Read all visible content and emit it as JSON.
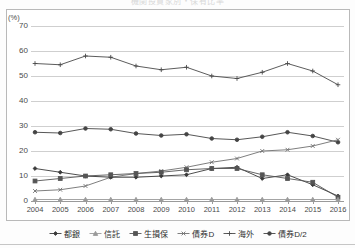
{
  "title": "機関投資家別・保有比率",
  "axis": {
    "y_unit": "(%)",
    "y_ticks": [
      70,
      60,
      50,
      40,
      30,
      20,
      10,
      0
    ],
    "y_min": 0,
    "y_max": 70,
    "x_ticks": [
      2004,
      2005,
      2006,
      2007,
      2008,
      2009,
      2010,
      2011,
      2012,
      2013,
      2014,
      2015,
      2016
    ]
  },
  "legend": {
    "position": "bottom",
    "items": [
      {
        "label": "都銀",
        "color": "#3a3a3a",
        "marker": "diamond"
      },
      {
        "label": "信託",
        "color": "#9a9a9a",
        "marker": "triangle"
      },
      {
        "label": "生損保",
        "color": "#555555",
        "marker": "square"
      },
      {
        "label": "債券D",
        "color": "#6f6f6f",
        "marker": "cross"
      },
      {
        "label": "海外",
        "color": "#4a4a4a",
        "marker": "plus"
      },
      {
        "label": "債券D/2",
        "color": "#444444",
        "marker": "dot"
      }
    ]
  },
  "chart_data": {
    "type": "line",
    "title": "機関投資家別・保有比率",
    "xlabel": "",
    "ylabel": "(%)",
    "ylim": [
      0,
      70
    ],
    "grid": true,
    "legend_position": "bottom",
    "categories": [
      2004,
      2005,
      2006,
      2007,
      2008,
      2009,
      2010,
      2011,
      2012,
      2013,
      2014,
      2015,
      2016
    ],
    "series": [
      {
        "name": "海外",
        "color": "#4a4a4a",
        "marker": "plus",
        "values": [
          55.0,
          54.5,
          58.0,
          57.5,
          54.0,
          52.5,
          53.5,
          50.0,
          49.0,
          51.5,
          55.0,
          52.0,
          46.5
        ]
      },
      {
        "name": "債券D/2",
        "color": "#444444",
        "marker": "dot",
        "values": [
          27.5,
          27.2,
          29.0,
          28.7,
          27.0,
          26.2,
          26.7,
          25.0,
          24.5,
          25.7,
          27.5,
          26.0,
          23.5
        ]
      },
      {
        "name": "債券D",
        "color": "#6f6f6f",
        "marker": "cross",
        "values": [
          4.0,
          4.5,
          6.0,
          9.5,
          11.0,
          12.0,
          13.5,
          15.5,
          17.0,
          20.0,
          20.5,
          22.0,
          24.5
        ]
      },
      {
        "name": "都銀",
        "color": "#3a3a3a",
        "marker": "diamond",
        "values": [
          13.0,
          11.5,
          10.0,
          9.5,
          9.5,
          10.0,
          10.5,
          13.0,
          13.5,
          9.0,
          10.5,
          6.5,
          2.0
        ]
      },
      {
        "name": "生損保",
        "color": "#555555",
        "marker": "square",
        "values": [
          8.0,
          9.0,
          10.0,
          10.5,
          11.0,
          11.5,
          12.5,
          13.0,
          13.0,
          10.5,
          9.0,
          7.5,
          1.5
        ]
      },
      {
        "name": "信託",
        "color": "#9a9a9a",
        "marker": "triangle",
        "values": [
          0.6,
          0.6,
          0.6,
          0.6,
          0.6,
          0.6,
          0.6,
          0.6,
          0.6,
          0.6,
          0.6,
          0.6,
          0.6
        ]
      }
    ]
  }
}
